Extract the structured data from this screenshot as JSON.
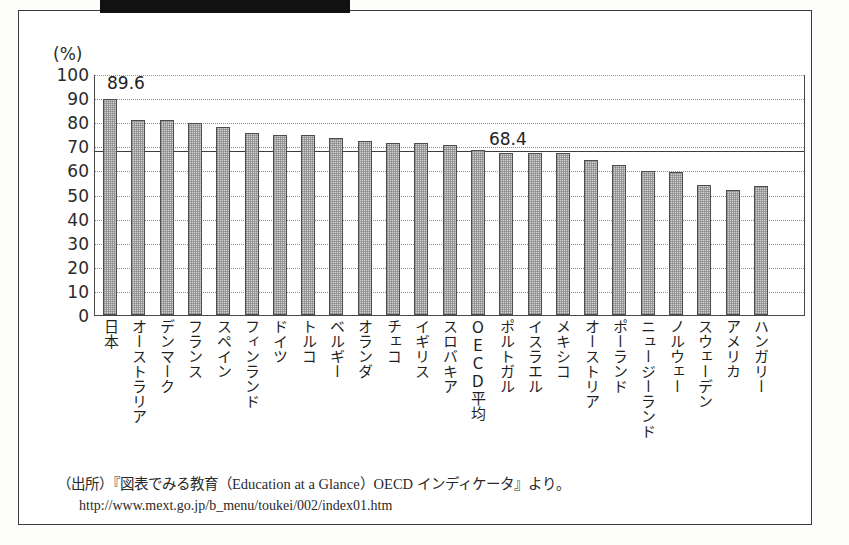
{
  "figure": {
    "title_band_text": "",
    "title_ghost_text": ""
  },
  "footnote": {
    "source_line": "（出所）『図表でみる教育（Education at a Glance）OECD インディケータ』より。",
    "url_line": "http://www.mext.go.jp/b_menu/toukei/002/index01.htm"
  },
  "chart_data": {
    "type": "bar",
    "title": "",
    "xlabel": "",
    "ylabel": "(%)",
    "ylim": [
      0,
      100
    ],
    "yticks": [
      100,
      90,
      80,
      70,
      60,
      50,
      40,
      30,
      20,
      10,
      0
    ],
    "grid": true,
    "legend": "none",
    "unit_label": "(%)",
    "reference_line": {
      "label": "68.4",
      "value": 68.4,
      "name": "OECD平均"
    },
    "annotations": [
      {
        "label": "89.6",
        "category": "日本",
        "value": 89.6
      },
      {
        "label": "68.4",
        "category": "OECD平均",
        "value": 68.4
      }
    ],
    "categories": [
      "日本",
      "オーストラリア",
      "デンマーク",
      "フランス",
      "スペイン",
      "フィンランド",
      "ドイツ",
      "トルコ",
      "ベルギー",
      "オランダ",
      "チェコ",
      "イギリス",
      "スロバキア",
      "OECD平均",
      "ポルトガル",
      "イスラエル",
      "メキシコ",
      "オーストリア",
      "ポーランド",
      "ニュージーランド",
      "ノルウェー",
      "スウェーデン",
      "アメリカ",
      "ハンガリー"
    ],
    "values": [
      89.6,
      81.0,
      81.0,
      79.8,
      78.2,
      75.4,
      74.9,
      74.9,
      73.3,
      72.2,
      71.3,
      71.2,
      70.6,
      68.4,
      67.2,
      67.3,
      67.2,
      64.5,
      62.3,
      59.8,
      59.3,
      53.8,
      51.7,
      53.5
    ]
  }
}
